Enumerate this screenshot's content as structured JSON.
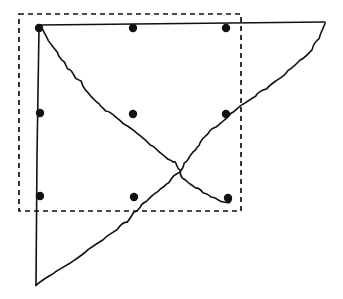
{
  "figure": {
    "title": "",
    "background_color": "#ffffff",
    "stroke_color": "#111111",
    "width": 343,
    "height": 299,
    "dashed_box": {
      "label": "dashed bounding rectangle",
      "x": 19,
      "y": 14,
      "width": 222,
      "height": 197,
      "dash_pattern": "5 4",
      "stroke_width": 1.7
    },
    "marker_points": [
      {
        "id": "p1",
        "label": "top-left marker",
        "cx": 39,
        "cy": 28
      },
      {
        "id": "p2",
        "label": "top-center marker",
        "cx": 133,
        "cy": 28
      },
      {
        "id": "p3",
        "label": "top-right marker",
        "cx": 226,
        "cy": 28
      },
      {
        "id": "p4",
        "label": "mid-left marker",
        "cx": 40,
        "cy": 113
      },
      {
        "id": "p5",
        "label": "mid-center marker",
        "cx": 133,
        "cy": 114
      },
      {
        "id": "p6",
        "label": "mid-right marker",
        "cx": 226,
        "cy": 114
      },
      {
        "id": "p7",
        "label": "bottom-left marker",
        "cx": 40,
        "cy": 196
      },
      {
        "id": "p8",
        "label": "bottom-center marker",
        "cx": 134,
        "cy": 197
      },
      {
        "id": "p9",
        "label": "bottom-right marker",
        "cx": 228,
        "cy": 198
      }
    ],
    "marker_radius": 4.2,
    "curves": [
      {
        "id": "curve-descending",
        "label": "descending jagged curve from top-left to bottom-right",
        "start": [
          42,
          28
        ],
        "end": [
          228,
          198
        ],
        "path": "M 42,28 C 44,33 46,36 49,40 C 52,45 55,48 57,52 C 59,56 60,58 63,60 C 65,62 66,65 69,68 C 71,70 72,73 74,75 C 76,78 77,80 80,82 C 83,85 84,88 86,90 C 88,93 90,95 92,97 C 95,99 97,101 99,104 C 101,106 104,108 106,110 C 109,112 112,114 115,116 C 118,118 121,121 124,123 C 127,125 130,128 133,130 C 136,132 139,134 142,137 C 145,139 147,141 150,144 C 153,146 155,148 158,150 C 161,153 163,155 166,157 C 168,159 170,160 172,161 C 174,162 175,163 176,165 C 177,167 178,169 179,171 C 180,173 181,175 183,177 C 185,179 187,181 189,183 C 191,184 194,186 196,188 C 198,189 201,191 203,192 C 206,194 209,195 212,197 C 215,198 218,200 221,201 C 224,202 227,203 229,202 C 231,201 232,199 231,197 C 230,195 228,195 227,196 C 226,197 226,198 227,199"
      },
      {
        "id": "curve-ascending",
        "label": "ascending jagged curve from bottom-left to top-right",
        "start": [
          36,
          285
        ],
        "end": [
          325,
          22
        ],
        "path": "M 36,285 C 42,281 48,277 54,273 C 60,269 66,265 72,261 C 78,257 83,254 88,250 C 93,247 98,243 103,239 C 108,236 112,232 117,229 C 121,226 124,223 127,221 C 130,219 132,216 134,213 C 136,211 138,209 140,207 C 142,205 144,203 147,201 C 149,199 151,197 154,195 C 156,193 159,191 161,189 C 164,186 166,184 169,182 C 171,180 173,178 175,176 C 177,174 179,172 181,170 C 183,168 184,166 185,164 C 186,162 186,160 188,158 C 190,156 192,154 194,152 C 196,150 197,148 198,146 C 199,144 200,142 202,140 C 204,138 206,136 208,134 C 211,131 213,129 216,127 C 219,124 222,122 225,119 C 228,117 231,114 234,112 C 237,109 241,106 244,104 C 248,101 251,98 255,96 C 258,93 262,90 266,88 C 270,85 273,82 277,80 C 281,77 285,74 289,71 C 293,68 297,64 301,61 C 304,58 308,54 311,50 C 314,46 317,42 319,38 C 321,33 323,28 325,24"
      }
    ],
    "lines": [
      {
        "id": "line-top-horizontal",
        "label": "near-horizontal top line",
        "start": [
          40,
          25
        ],
        "end": [
          325,
          22
        ]
      },
      {
        "id": "line-left-vertical",
        "label": "vertical left line",
        "start": [
          39,
          28
        ],
        "end": [
          36,
          285
        ]
      }
    ]
  }
}
